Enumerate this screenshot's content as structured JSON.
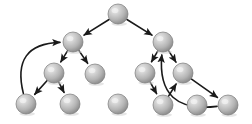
{
  "figure": {
    "title": "Directed graph traversal tree with back edges",
    "type": "node-link-diagram",
    "background_color": "#ffffff",
    "canvas": {
      "width": 252,
      "height": 124
    }
  },
  "style": {
    "node_radius": 10,
    "node_fill_light": "#e8e8e8",
    "node_fill_mid": "#bdbdbd",
    "node_fill_dark": "#8f8f8f",
    "node_edge_color": "#7a7a7a",
    "edge_color": "#1a1a1a",
    "edge_width": 1.6,
    "arrow_head_length": 6,
    "arrow_head_width": 5
  },
  "nodes": [
    {
      "id": "n0",
      "label": "",
      "level": 0,
      "x": 118,
      "y": 14,
      "r": 10
    },
    {
      "id": "n1",
      "label": "",
      "level": 1,
      "x": 73,
      "y": 42,
      "r": 10
    },
    {
      "id": "n2",
      "label": "",
      "level": 1,
      "x": 163,
      "y": 42,
      "r": 10
    },
    {
      "id": "n3",
      "label": "",
      "level": 2,
      "x": 54,
      "y": 73,
      "r": 10
    },
    {
      "id": "n4",
      "label": "",
      "level": 2,
      "x": 95,
      "y": 74,
      "r": 10
    },
    {
      "id": "n5",
      "label": "",
      "level": 2,
      "x": 145,
      "y": 73,
      "r": 10
    },
    {
      "id": "n6",
      "label": "",
      "level": 2,
      "x": 183,
      "y": 73,
      "r": 10
    },
    {
      "id": "n7",
      "label": "",
      "level": 3,
      "x": 26,
      "y": 104,
      "r": 10
    },
    {
      "id": "n8",
      "label": "",
      "level": 3,
      "x": 70,
      "y": 104,
      "r": 10
    },
    {
      "id": "n9",
      "label": "",
      "level": 3,
      "x": 118,
      "y": 104,
      "r": 10
    },
    {
      "id": "n10",
      "label": "",
      "level": 3,
      "x": 163,
      "y": 105,
      "r": 10
    },
    {
      "id": "n11",
      "label": "",
      "level": 3,
      "x": 197,
      "y": 105,
      "r": 10
    },
    {
      "id": "n12",
      "label": "",
      "level": 3,
      "x": 228,
      "y": 105,
      "r": 10
    }
  ],
  "edges": [
    {
      "id": "e0",
      "from": "n0",
      "to": "n1",
      "kind": "straight",
      "arrow": true
    },
    {
      "id": "e1",
      "from": "n0",
      "to": "n2",
      "kind": "straight",
      "arrow": true
    },
    {
      "id": "e2",
      "from": "n1",
      "to": "n3",
      "kind": "straight",
      "arrow": true
    },
    {
      "id": "e3",
      "from": "n1",
      "to": "n4",
      "kind": "straight",
      "arrow": true
    },
    {
      "id": "e4",
      "from": "n3",
      "to": "n7",
      "kind": "straight",
      "arrow": true
    },
    {
      "id": "e5",
      "from": "n3",
      "to": "n8",
      "kind": "straight",
      "arrow": true
    },
    {
      "id": "e6",
      "from": "n2",
      "to": "n5",
      "kind": "straight",
      "arrow": true
    },
    {
      "id": "e7",
      "from": "n2",
      "to": "n6",
      "kind": "straight",
      "arrow": true
    },
    {
      "id": "e8",
      "from": "n5",
      "to": "n10",
      "kind": "straight",
      "arrow": true
    },
    {
      "id": "e9",
      "from": "n10",
      "to": "n6",
      "kind": "straight",
      "arrow": true
    },
    {
      "id": "e10",
      "from": "n6",
      "to": "n12",
      "kind": "straight",
      "arrow": true
    },
    {
      "id": "e11",
      "from": "n7",
      "to": "n1",
      "kind": "curved",
      "arrow": true,
      "curvature": -1.0,
      "note": "long back edge left"
    },
    {
      "id": "e12",
      "from": "n12",
      "to": "n2",
      "kind": "curved",
      "arrow": true,
      "curvature": -1.0,
      "note": "long back edge right"
    }
  ],
  "legend": {
    "visible": false,
    "entries": []
  },
  "annotations": []
}
